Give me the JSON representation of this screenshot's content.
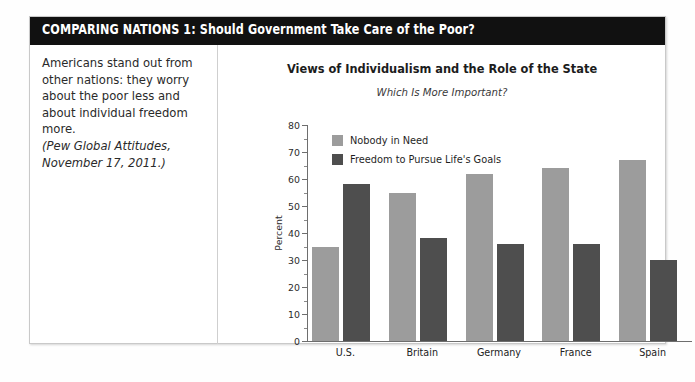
{
  "header": {
    "title": "COMPARING NATIONS 1: Should Government Take Care of the Poor?",
    "background": "#111111",
    "text_color": "#ffffff"
  },
  "note": {
    "body": "Americans stand out from other nations: they worry about the poor less and about individual freedom more.",
    "citation": "(Pew Global Attitudes, November 17, 2011.)"
  },
  "chart_data": {
    "type": "bar",
    "title": "Views of Individualism and the Role of the State",
    "subtitle": "Which Is More Important?",
    "xlabel": "",
    "ylabel": "Percent",
    "ylim": [
      0,
      80
    ],
    "yticks": [
      0,
      10,
      20,
      30,
      40,
      50,
      60,
      70,
      80
    ],
    "ytick_labels": [
      "0",
      "10",
      "20",
      "30",
      "40",
      "50",
      "60",
      "70",
      "80"
    ],
    "grid": false,
    "legend_position": "upper-left-inside",
    "categories": [
      "U.S.",
      "Britain",
      "Germany",
      "France",
      "Spain"
    ],
    "series": [
      {
        "name": "Nobody in Need",
        "color": "#9c9c9c",
        "values": [
          35,
          55,
          62,
          64,
          67
        ]
      },
      {
        "name": "Freedom to Pursue Life's Goals",
        "color": "#4e4e4e",
        "values": [
          58,
          38,
          36,
          36,
          30
        ]
      }
    ]
  }
}
